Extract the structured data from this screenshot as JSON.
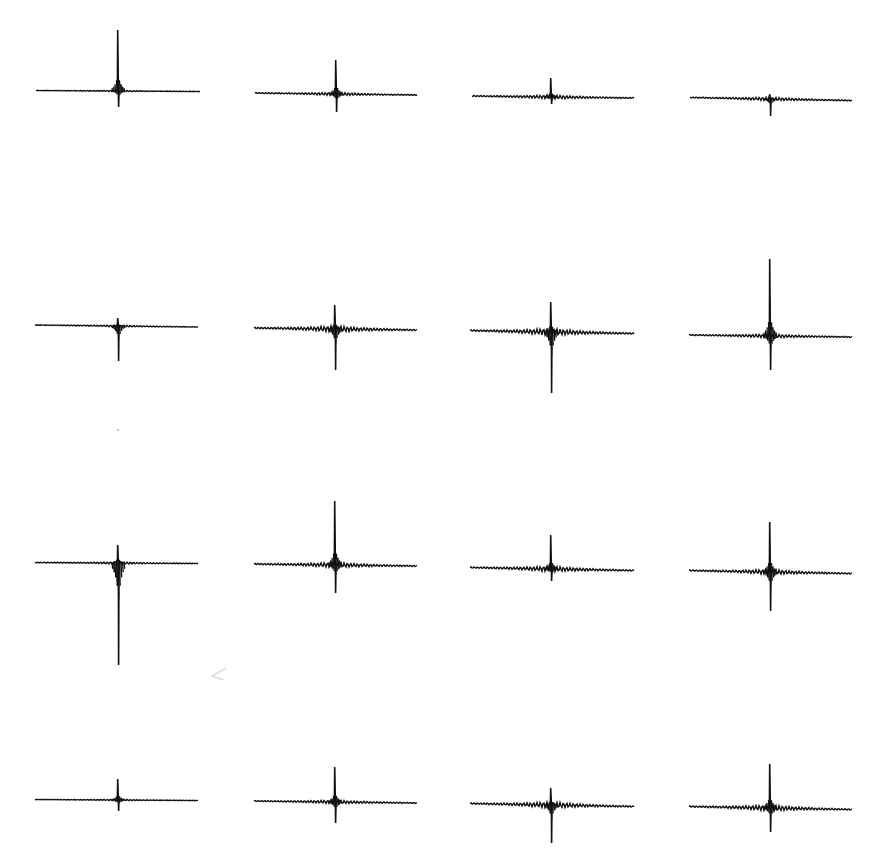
{
  "figure": {
    "background": "#ffffff",
    "trace_color": "#111111",
    "caption": "",
    "rows": 4,
    "cols": 4
  },
  "chart_data": {
    "type": "line",
    "title": "",
    "xlabel": "",
    "ylabel": "",
    "grid": false,
    "legend": null,
    "panels": [
      {
        "row": 1,
        "col": 1,
        "x0": 36,
        "x1": 200,
        "baseline": 91,
        "spike_x": 118,
        "peak_top": 30,
        "peak_bottom": 107,
        "ring": 0.6,
        "tilt": 1
      },
      {
        "row": 1,
        "col": 2,
        "x0": 255,
        "x1": 417,
        "baseline": 94,
        "spike_x": 336,
        "peak_top": 60,
        "peak_bottom": 112,
        "ring": 1.5,
        "tilt": 2
      },
      {
        "row": 1,
        "col": 3,
        "x0": 472,
        "x1": 634,
        "baseline": 97,
        "spike_x": 551,
        "peak_top": 78,
        "peak_bottom": 104,
        "ring": 1.8,
        "tilt": 2
      },
      {
        "row": 1,
        "col": 4,
        "x0": 690,
        "x1": 852,
        "baseline": 99,
        "spike_x": 770,
        "peak_top": 94,
        "peak_bottom": 116,
        "ring": 1.6,
        "tilt": 3
      },
      {
        "row": 2,
        "col": 1,
        "x0": 35,
        "x1": 198,
        "baseline": 326,
        "spike_x": 118,
        "peak_top": 318,
        "peak_bottom": 361,
        "ring": 0.8,
        "tilt": 2
      },
      {
        "row": 2,
        "col": 2,
        "x0": 254,
        "x1": 417,
        "baseline": 329,
        "spike_x": 335,
        "peak_top": 305,
        "peak_bottom": 370,
        "ring": 3.0,
        "tilt": 2
      },
      {
        "row": 2,
        "col": 3,
        "x0": 470,
        "x1": 634,
        "baseline": 332,
        "spike_x": 551,
        "peak_top": 302,
        "peak_bottom": 393,
        "ring": 3.5,
        "tilt": 3
      },
      {
        "row": 2,
        "col": 4,
        "x0": 689,
        "x1": 852,
        "baseline": 336,
        "spike_x": 770,
        "peak_top": 259,
        "peak_bottom": 370,
        "ring": 1.8,
        "tilt": 2
      },
      {
        "row": 3,
        "col": 1,
        "x0": 35,
        "x1": 198,
        "baseline": 563,
        "spike_x": 118,
        "peak_top": 545,
        "peak_bottom": 665,
        "ring": 1.0,
        "tilt": 1
      },
      {
        "row": 3,
        "col": 2,
        "x0": 254,
        "x1": 417,
        "baseline": 565,
        "spike_x": 335,
        "peak_top": 501,
        "peak_bottom": 593,
        "ring": 2.4,
        "tilt": 2
      },
      {
        "row": 3,
        "col": 3,
        "x0": 470,
        "x1": 634,
        "baseline": 569,
        "spike_x": 551,
        "peak_top": 535,
        "peak_bottom": 581,
        "ring": 2.6,
        "tilt": 3
      },
      {
        "row": 3,
        "col": 4,
        "x0": 689,
        "x1": 852,
        "baseline": 572,
        "spike_x": 770,
        "peak_top": 522,
        "peak_bottom": 611,
        "ring": 2.4,
        "tilt": 3
      },
      {
        "row": 4,
        "col": 1,
        "x0": 35,
        "x1": 198,
        "baseline": 800,
        "spike_x": 118,
        "peak_top": 779,
        "peak_bottom": 811,
        "ring": 0.6,
        "tilt": 1
      },
      {
        "row": 4,
        "col": 2,
        "x0": 254,
        "x1": 417,
        "baseline": 802,
        "spike_x": 335,
        "peak_top": 767,
        "peak_bottom": 823,
        "ring": 1.6,
        "tilt": 2
      },
      {
        "row": 4,
        "col": 3,
        "x0": 470,
        "x1": 634,
        "baseline": 805,
        "spike_x": 551,
        "peak_top": 788,
        "peak_bottom": 843,
        "ring": 3.0,
        "tilt": 3
      },
      {
        "row": 4,
        "col": 4,
        "x0": 689,
        "x1": 852,
        "baseline": 808,
        "spike_x": 770,
        "peak_top": 764,
        "peak_bottom": 832,
        "ring": 2.8,
        "tilt": 3
      }
    ]
  }
}
